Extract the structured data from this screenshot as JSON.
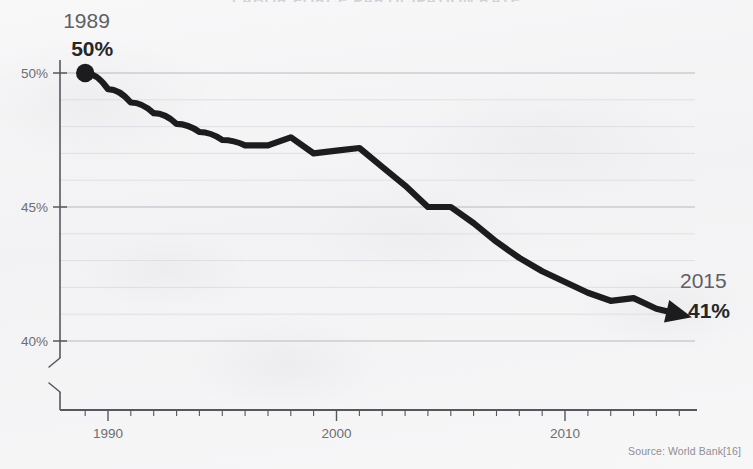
{
  "figure": {
    "cut_off_title": "LABOR FORCE PARTICIPATION RATE",
    "source_note": "Source: World Bank[16]"
  },
  "callouts": {
    "start": {
      "year": "1989",
      "value": "50%"
    },
    "end": {
      "year": "2015",
      "value": "41%"
    }
  },
  "axes": {
    "y_ticks": [
      "50%",
      "45%",
      "40%"
    ],
    "x_ticks": [
      "1990",
      "2000",
      "2010"
    ]
  },
  "colors": {
    "line": "#1c1c1f",
    "grid_major": "#b9b9c0",
    "grid_minor": "#d9d9df",
    "axis": "#57575d",
    "tick_text": "#6d6d73",
    "value_text": "#262629",
    "year_text": "#5f5f66",
    "source_text": "#8e8e95",
    "paper": "#f6f6f7"
  },
  "chart_data": {
    "type": "line",
    "title": "LABOR FORCE PARTICIPATION RATE",
    "xlabel": "",
    "ylabel": "",
    "xlim": [
      1988.4,
      2016.2
    ],
    "ylim": [
      39.2,
      50.6
    ],
    "grid": true,
    "grid_major_values": [
      50,
      45,
      40
    ],
    "grid_minor_step": 1,
    "legend": "none",
    "y_axis_break": true,
    "x_tick_values": [
      1990,
      2000,
      2010
    ],
    "x_minor_tick_step": 1,
    "y_tick_values": [
      50,
      45,
      40
    ],
    "y_tick_labels": [
      "50%",
      "45%",
      "40%"
    ],
    "units": "percent",
    "annotations": [
      {
        "x": 1989,
        "y": 50,
        "year_label": "1989",
        "value_label": "50%",
        "marker": "dot"
      },
      {
        "x": 2015,
        "y": 41,
        "year_label": "2015",
        "value_label": "41%",
        "marker": "arrow"
      }
    ],
    "series": [
      {
        "name": "Labor force participation rate",
        "x": [
          1989,
          1990,
          1991,
          1992,
          1993,
          1994,
          1995,
          1996,
          1997,
          1998,
          1999,
          2000,
          2001,
          2002,
          2003,
          2004,
          2005,
          2006,
          2007,
          2008,
          2009,
          2010,
          2011,
          2012,
          2013,
          2014,
          2015
        ],
        "values": [
          50.0,
          49.4,
          48.9,
          48.5,
          48.1,
          47.8,
          47.5,
          47.3,
          47.3,
          47.6,
          47.0,
          47.1,
          47.2,
          46.5,
          45.8,
          45.0,
          45.0,
          44.4,
          43.7,
          43.1,
          42.6,
          42.2,
          41.8,
          41.5,
          41.6,
          41.2,
          41.0
        ]
      }
    ]
  }
}
